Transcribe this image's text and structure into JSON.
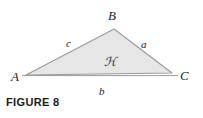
{
  "figure": {
    "caption": "FIGURE 8",
    "background_color": "#ffffff",
    "stroke_color": "#9a9a9a",
    "fill_color": "#e6e6e6",
    "text_color": "#232323"
  },
  "diagram": {
    "type": "triangle",
    "vertices": [
      {
        "name": "A",
        "label": "A",
        "x": 26,
        "y": 75,
        "label_x": 11,
        "label_y": 80
      },
      {
        "name": "B",
        "label": "B",
        "x": 114,
        "y": 29,
        "label_x": 110,
        "label_y": 19
      },
      {
        "name": "C",
        "label": "C",
        "x": 172,
        "y": 73,
        "label_x": 181,
        "label_y": 79
      }
    ],
    "sides": [
      {
        "name": "side-a",
        "label": "a",
        "between": "B-C",
        "label_x": 143,
        "label_y": 47
      },
      {
        "name": "side-b",
        "label": "b",
        "between": "A-C",
        "label_x": 101,
        "label_y": 93
      },
      {
        "name": "side-c",
        "label": "c",
        "between": "A-B",
        "label_x": 69,
        "label_y": 44
      }
    ],
    "area": {
      "name": "area-symbol",
      "label": "ℋ",
      "display": "A",
      "x": 110,
      "y": 62
    },
    "baseline": {
      "x1": 22,
      "y1": 76,
      "x2": 177,
      "y2": 76
    }
  }
}
